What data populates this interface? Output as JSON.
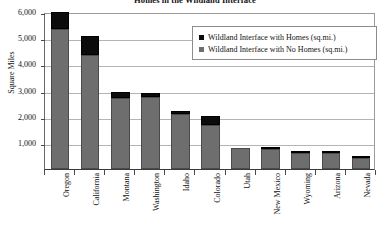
{
  "chart_data": {
    "type": "bar",
    "title": "Homes in the Wildland Interface",
    "xlabel": "",
    "ylabel": "Square Miles",
    "ylim": [
      0,
      6000
    ],
    "ytick_labels": [
      "6,000",
      "5,000",
      "4,000",
      "3,000",
      "2,000",
      "1,000"
    ],
    "ytick_values": [
      6000,
      5000,
      4000,
      3000,
      2000,
      1000
    ],
    "grid": true,
    "stacked": true,
    "legend_position": "top-right inside plot",
    "categories": [
      "Oregon",
      "California",
      "Montana",
      "Washington",
      "Idaho",
      "Colorado",
      "Utah",
      "New Mexico",
      "Wyoming",
      "Arizona",
      "Nevada"
    ],
    "series": [
      {
        "name": "Wildland Interface with No Homes (sq.mi.)",
        "color": "#6e6e6e",
        "values": [
          5350,
          4350,
          2700,
          2750,
          2100,
          1700,
          800,
          750,
          620,
          600,
          440
        ]
      },
      {
        "name": "Wildland Interface with Homes (sq.mi.)",
        "color": "#0b0b0b",
        "values": [
          650,
          750,
          250,
          170,
          130,
          330,
          0,
          110,
          40,
          60,
          20
        ]
      }
    ],
    "totals": [
      6000,
      5100,
      2950,
      2920,
      2230,
      2030,
      800,
      860,
      660,
      660,
      460
    ]
  },
  "legend": {
    "entries": [
      {
        "label": "Wildland Interface with Homes (sq.mi.)",
        "color": "#0b0b0b"
      },
      {
        "label": "Wildland Interface with No Homes (sq.mi.)",
        "color": "#6e6e6e"
      }
    ]
  }
}
